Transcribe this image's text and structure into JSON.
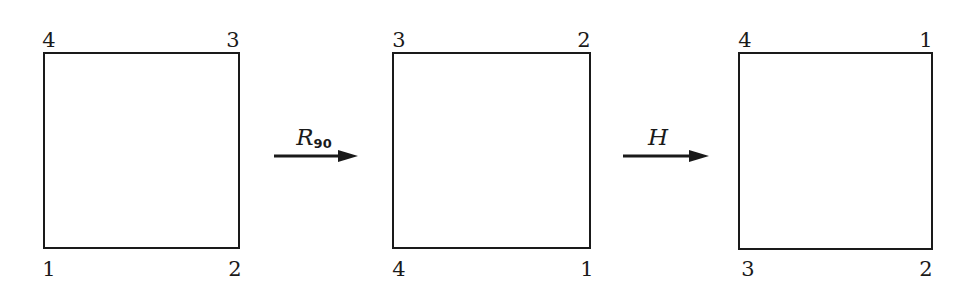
{
  "diagram": {
    "title": "",
    "colors": {
      "stroke": "#1a1a1a",
      "background": "#ffffff"
    },
    "squares": [
      {
        "id": "initial",
        "corners": {
          "top_left": "4",
          "top_right": "3",
          "bottom_left": "1",
          "bottom_right": "2"
        }
      },
      {
        "id": "after-rotation",
        "corners": {
          "top_left": "3",
          "top_right": "2",
          "bottom_left": "4",
          "bottom_right": "1"
        }
      },
      {
        "id": "after-flip",
        "corners": {
          "top_left": "4",
          "top_right": "1",
          "bottom_left": "3",
          "bottom_right": "2"
        }
      }
    ],
    "arrows": [
      {
        "id": "rotation",
        "label_main": "R",
        "label_sub": "90"
      },
      {
        "id": "horizontal-flip",
        "label_main": "H",
        "label_sub": ""
      }
    ]
  }
}
